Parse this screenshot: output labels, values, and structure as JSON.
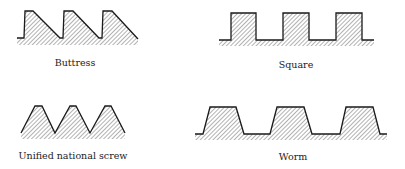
{
  "figure": {
    "colors": {
      "stroke": "#1a1a1a",
      "hatch": "#555555",
      "text": "#222222"
    },
    "panels": [
      {
        "id": "buttress",
        "label": "Buttress",
        "profile": "17,38 24,38 25,11 33,11 60,38 63,38 64,11 73,11 99,38 102,38 103,11 112,11 138,39",
        "label_x": 75,
        "label_y": 66
      },
      {
        "id": "square",
        "label": "Square",
        "profile": "219,40 231,40 231,13 256,13 256,40 283,40 283,13 309,13 309,40 336,40 336,13 362,13 362,40 374,40",
        "label_x": 296,
        "label_y": 68
      },
      {
        "id": "unified-national-screw",
        "label": "Unified national screw",
        "profile": "21,133 35,106 42,106 55,133 70,106 76,106 90,133 105,106 111,106 125,133",
        "label_x": 73,
        "label_y": 159
      },
      {
        "id": "worm",
        "label": "Worm",
        "profile": "195,134 203,134 210,107 236,107 244,134 270,134 277,107 304,107 312,134 340,134 346,107 373,107 380,134 387,134",
        "label_x": 293,
        "label_y": 160
      }
    ]
  }
}
